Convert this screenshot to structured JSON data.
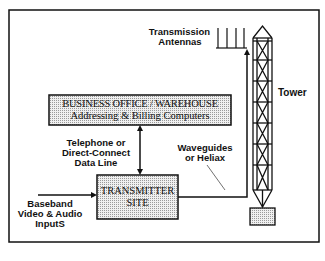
{
  "diagram": {
    "type": "block-diagram",
    "title": "",
    "nodes": {
      "business_office": {
        "line1": "BUSINESS OFFICE / WAREHOUSE",
        "line2": "Addressing & Billing Computers"
      },
      "transmitter": {
        "line1": "TRANSMITTER",
        "line2": "SITE"
      },
      "tower": {
        "label": "Tower"
      },
      "antennas": {
        "line1": "Transmission",
        "line2": "Antennas"
      }
    },
    "edge_labels": {
      "telephone": {
        "line1": "Telephone or",
        "line2": "Direct-Connect",
        "line3": "Data Line"
      },
      "waveguides": {
        "line1": "Waveguides",
        "line2": "or Heliax"
      },
      "inputs": {
        "line1": "Baseband",
        "line2": "Video & Audio",
        "line3": "InputS"
      }
    },
    "edges": [
      {
        "from": "business_office",
        "to": "transmitter",
        "label": "telephone",
        "bidirectional": true
      },
      {
        "from": "inputs",
        "to": "transmitter",
        "label": "inputs"
      },
      {
        "from": "transmitter",
        "to": "antennas",
        "label": "waveguides"
      }
    ],
    "colors": {
      "stroke": "#111111",
      "box_fill": "#e6e6e6",
      "background": "#ffffff"
    }
  }
}
